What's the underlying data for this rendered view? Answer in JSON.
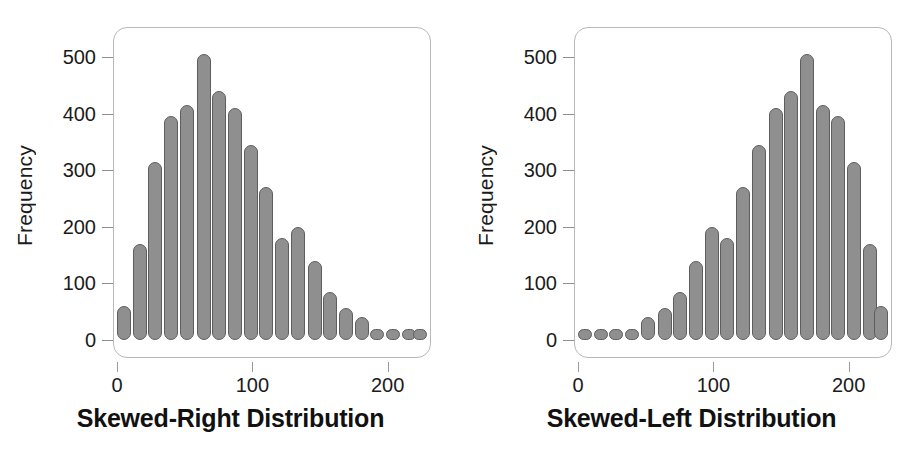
{
  "chart_data": [
    {
      "type": "bar",
      "title": "Skewed-Right Distribution",
      "xlabel": "",
      "ylabel": "Frequency",
      "ylim": [
        0,
        530
      ],
      "xlim": [
        -3,
        232
      ],
      "yticks": [
        0,
        100,
        200,
        300,
        400,
        500
      ],
      "ytick_labels": [
        "0",
        "100",
        "200",
        "300",
        "400",
        "500"
      ],
      "xticks": [
        0,
        100,
        200
      ],
      "xtick_labels": [
        "0",
        "100",
        "200"
      ],
      "grid": false,
      "legend": "none",
      "bin_width": 11.7,
      "categories": [
        5,
        17,
        28,
        40,
        52,
        64,
        75,
        87,
        99,
        110,
        122,
        134,
        146,
        157,
        169,
        181,
        192,
        204,
        216,
        224
      ],
      "values": [
        60,
        170,
        315,
        395,
        415,
        505,
        440,
        410,
        345,
        270,
        180,
        200,
        140,
        85,
        57,
        40,
        12,
        10,
        8,
        8
      ],
      "bar_color": "#8f8f8f",
      "bar_edge_color": "#5e5e5e"
    },
    {
      "type": "bar",
      "title": "Skewed-Left Distribution",
      "xlabel": "",
      "ylabel": "Frequency",
      "ylim": [
        0,
        530
      ],
      "xlim": [
        -3,
        232
      ],
      "yticks": [
        0,
        100,
        200,
        300,
        400,
        500
      ],
      "ytick_labels": [
        "0",
        "100",
        "200",
        "300",
        "400",
        "500"
      ],
      "xticks": [
        0,
        100,
        200
      ],
      "xtick_labels": [
        "0",
        "100",
        "200"
      ],
      "grid": false,
      "legend": "none",
      "bin_width": 11.7,
      "categories": [
        5,
        17,
        28,
        40,
        52,
        64,
        75,
        87,
        99,
        110,
        122,
        134,
        146,
        157,
        169,
        181,
        192,
        204,
        216,
        224
      ],
      "values": [
        8,
        8,
        10,
        12,
        40,
        57,
        85,
        140,
        200,
        180,
        270,
        345,
        410,
        440,
        505,
        415,
        395,
        315,
        170,
        60
      ],
      "bar_color": "#8f8f8f",
      "bar_edge_color": "#5e5e5e"
    }
  ],
  "panels": [
    {
      "id": "skewed-right",
      "title": "Skewed-Right Distribution",
      "ylabel": "Frequency"
    },
    {
      "id": "skewed-left",
      "title": "Skewed-Left Distribution",
      "ylabel": "Frequency"
    }
  ]
}
